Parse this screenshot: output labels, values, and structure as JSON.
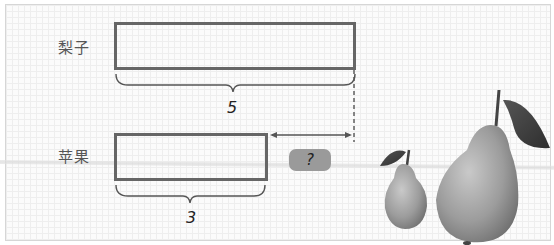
{
  "diagram": {
    "rows": [
      {
        "label": "梨子",
        "value": "5"
      },
      {
        "label": "苹果",
        "value": "3"
      }
    ],
    "question": "?",
    "colors": {
      "box_border": "#666666",
      "badge_fill": "#9a9a9a",
      "brace": "#555555"
    },
    "illustration": "two pears with leaves"
  }
}
